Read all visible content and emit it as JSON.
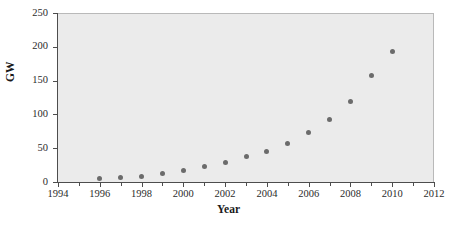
{
  "chart_data": {
    "type": "scatter",
    "title": "",
    "xlabel": "Year",
    "ylabel": "GW",
    "xlim": [
      1994,
      2012
    ],
    "ylim": [
      0,
      250
    ],
    "grid": false,
    "legend": null,
    "marker": {
      "shape": "circle",
      "color": "#6b6b6b",
      "size": 5
    },
    "plot_background": "#ebebeb",
    "figure_background": "#ffffff",
    "axis_color": "#4d4d4d",
    "x_ticks": [
      1994,
      1996,
      1998,
      2000,
      2002,
      2004,
      2006,
      2008,
      2010,
      2012
    ],
    "x_tick_labels": [
      "1994",
      "1996",
      "1998",
      "2000",
      "2002",
      "2004",
      "2006",
      "2008",
      "2010",
      "2012"
    ],
    "x_minor_ticks": [
      1995,
      1997,
      1999,
      2001,
      2003,
      2005,
      2007,
      2009,
      2011
    ],
    "y_ticks": [
      0,
      50,
      100,
      150,
      200,
      250
    ],
    "y_tick_labels": [
      "0",
      "50",
      "100",
      "150",
      "200",
      "250"
    ],
    "x": [
      1996,
      1997,
      1998,
      1999,
      2000,
      2001,
      2002,
      2003,
      2004,
      2005,
      2006,
      2007,
      2008,
      2009,
      2010
    ],
    "values": [
      6,
      8,
      10,
      14,
      18,
      24,
      31,
      39,
      47,
      59,
      74,
      94,
      121,
      159,
      194
    ],
    "points": [
      {
        "x": 1996,
        "y": 6
      },
      {
        "x": 1997,
        "y": 8
      },
      {
        "x": 1998,
        "y": 10
      },
      {
        "x": 1999,
        "y": 14
      },
      {
        "x": 2000,
        "y": 18
      },
      {
        "x": 2001,
        "y": 24
      },
      {
        "x": 2002,
        "y": 31
      },
      {
        "x": 2003,
        "y": 39
      },
      {
        "x": 2004,
        "y": 47
      },
      {
        "x": 2005,
        "y": 59
      },
      {
        "x": 2006,
        "y": 74
      },
      {
        "x": 2007,
        "y": 94
      },
      {
        "x": 2008,
        "y": 121
      },
      {
        "x": 2009,
        "y": 159
      },
      {
        "x": 2010,
        "y": 194
      }
    ]
  }
}
